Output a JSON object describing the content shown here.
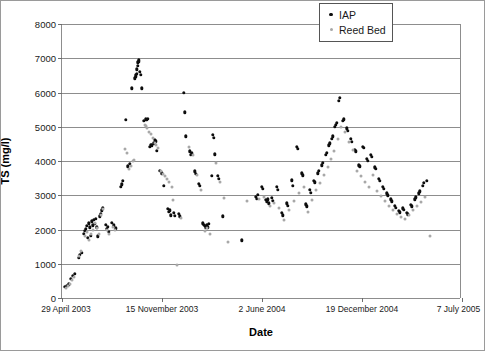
{
  "chart_data": {
    "type": "scatter",
    "title": "",
    "xlabel": "Date",
    "ylabel": "TS (mg/l)",
    "ylim": [
      0,
      8000
    ],
    "ytick_values": [
      0,
      1000,
      2000,
      3000,
      4000,
      5000,
      6000,
      7000,
      8000
    ],
    "ytick_labels": [
      "0",
      "1000",
      "2000",
      "3000",
      "4000",
      "5000",
      "6000",
      "7000",
      "8000"
    ],
    "xtick_labels": [
      "29 April 2003",
      "15 November 2003",
      "2 June 2004",
      "19 December 2004",
      "7 July 2005"
    ],
    "xtick_positions": [
      0,
      0.25,
      0.5,
      0.75,
      1.0
    ],
    "xlim_days": [
      0,
      800
    ],
    "grid": "horizontal",
    "legend_position": "top-right",
    "series": [
      {
        "name": "IAP",
        "color": "#0d0d0d",
        "marker": "filled-circle",
        "points": [
          [
            6,
            320
          ],
          [
            10,
            360
          ],
          [
            14,
            400
          ],
          [
            18,
            560
          ],
          [
            22,
            640
          ],
          [
            26,
            700
          ],
          [
            33,
            1180
          ],
          [
            36,
            1260
          ],
          [
            39,
            1320
          ],
          [
            44,
            1880
          ],
          [
            46,
            1960
          ],
          [
            48,
            2020
          ],
          [
            50,
            2100
          ],
          [
            52,
            1760
          ],
          [
            54,
            2180
          ],
          [
            56,
            2060
          ],
          [
            58,
            1820
          ],
          [
            60,
            2240
          ],
          [
            62,
            2120
          ],
          [
            64,
            2280
          ],
          [
            66,
            2160
          ],
          [
            68,
            2320
          ],
          [
            70,
            2060
          ],
          [
            72,
            1800
          ],
          [
            76,
            2380
          ],
          [
            78,
            2460
          ],
          [
            80,
            2560
          ],
          [
            82,
            2640
          ],
          [
            88,
            2140
          ],
          [
            90,
            2020
          ],
          [
            92,
            2080
          ],
          [
            94,
            1940
          ],
          [
            100,
            2200
          ],
          [
            104,
            2120
          ],
          [
            108,
            2040
          ],
          [
            118,
            3240
          ],
          [
            120,
            3320
          ],
          [
            122,
            3420
          ],
          [
            128,
            5200
          ],
          [
            132,
            3840
          ],
          [
            136,
            3920
          ],
          [
            140,
            6120
          ],
          [
            146,
            6420
          ],
          [
            147,
            6460
          ],
          [
            148,
            6500
          ],
          [
            149,
            6550
          ],
          [
            150,
            6680
          ],
          [
            151,
            6780
          ],
          [
            152,
            6880
          ],
          [
            153,
            6940
          ],
          [
            154,
            6900
          ],
          [
            156,
            6600
          ],
          [
            158,
            6520
          ],
          [
            160,
            6120
          ],
          [
            164,
            5180
          ],
          [
            168,
            5220
          ],
          [
            170,
            5200
          ],
          [
            172,
            5240
          ],
          [
            176,
            4420
          ],
          [
            178,
            4480
          ],
          [
            180,
            4460
          ],
          [
            184,
            4520
          ],
          [
            186,
            4620
          ],
          [
            188,
            4580
          ],
          [
            190,
            4300
          ],
          [
            196,
            3720
          ],
          [
            200,
            3640
          ],
          [
            204,
            3280
          ],
          [
            212,
            2600
          ],
          [
            214,
            2520
          ],
          [
            216,
            2560
          ],
          [
            218,
            2420
          ],
          [
            224,
            2480
          ],
          [
            226,
            2400
          ],
          [
            234,
            2460
          ],
          [
            236,
            2380
          ],
          [
            244,
            6000
          ],
          [
            246,
            5420
          ],
          [
            248,
            4720
          ],
          [
            256,
            4280
          ],
          [
            258,
            4180
          ],
          [
            260,
            4220
          ],
          [
            266,
            3700
          ],
          [
            268,
            3620
          ],
          [
            274,
            3340
          ],
          [
            276,
            3280
          ],
          [
            282,
            2180
          ],
          [
            284,
            2140
          ],
          [
            286,
            2100
          ],
          [
            288,
            2060
          ],
          [
            290,
            2120
          ],
          [
            292,
            2060
          ],
          [
            294,
            2160
          ],
          [
            300,
            3560
          ],
          [
            302,
            4760
          ],
          [
            304,
            4680
          ],
          [
            306,
            4200
          ],
          [
            312,
            3560
          ],
          [
            314,
            3480
          ],
          [
            322,
            2380
          ],
          [
            360,
            1680
          ],
          [
            388,
            2960
          ],
          [
            390,
            2900
          ],
          [
            392,
            3020
          ],
          [
            400,
            3240
          ],
          [
            402,
            3180
          ],
          [
            408,
            2860
          ],
          [
            410,
            2800
          ],
          [
            412,
            2880
          ],
          [
            414,
            2760
          ],
          [
            420,
            2920
          ],
          [
            422,
            2840
          ],
          [
            430,
            3240
          ],
          [
            432,
            3160
          ],
          [
            440,
            2480
          ],
          [
            442,
            2420
          ],
          [
            450,
            2760
          ],
          [
            452,
            2700
          ],
          [
            460,
            3440
          ],
          [
            462,
            3280
          ],
          [
            470,
            4420
          ],
          [
            472,
            4360
          ],
          [
            480,
            3640
          ],
          [
            482,
            3580
          ],
          [
            488,
            2740
          ],
          [
            490,
            2680
          ],
          [
            496,
            3160
          ],
          [
            498,
            3080
          ],
          [
            504,
            3420
          ],
          [
            506,
            3380
          ],
          [
            512,
            3640
          ],
          [
            514,
            3720
          ],
          [
            520,
            3880
          ],
          [
            522,
            3940
          ],
          [
            528,
            4180
          ],
          [
            530,
            4240
          ],
          [
            534,
            4460
          ],
          [
            536,
            4520
          ],
          [
            540,
            4640
          ],
          [
            542,
            4720
          ],
          [
            546,
            5000
          ],
          [
            548,
            5060
          ],
          [
            550,
            5120
          ],
          [
            554,
            5760
          ],
          [
            556,
            5840
          ],
          [
            562,
            5180
          ],
          [
            564,
            5220
          ],
          [
            570,
            4960
          ],
          [
            572,
            4880
          ],
          [
            578,
            4640
          ],
          [
            580,
            4560
          ],
          [
            586,
            4320
          ],
          [
            588,
            4280
          ],
          [
            594,
            3880
          ],
          [
            596,
            3840
          ],
          [
            602,
            4420
          ],
          [
            604,
            4380
          ],
          [
            610,
            4060
          ],
          [
            612,
            4000
          ],
          [
            618,
            4180
          ],
          [
            620,
            4120
          ],
          [
            626,
            3820
          ],
          [
            628,
            3780
          ],
          [
            634,
            3480
          ],
          [
            636,
            3420
          ],
          [
            642,
            3240
          ],
          [
            644,
            3180
          ],
          [
            650,
            3060
          ],
          [
            652,
            3000
          ],
          [
            658,
            2880
          ],
          [
            660,
            2820
          ],
          [
            666,
            2700
          ],
          [
            668,
            2640
          ],
          [
            674,
            2540
          ],
          [
            676,
            2500
          ],
          [
            682,
            2620
          ],
          [
            684,
            2580
          ],
          [
            690,
            2480
          ],
          [
            692,
            2440
          ],
          [
            698,
            2720
          ],
          [
            700,
            2680
          ],
          [
            706,
            2880
          ],
          [
            708,
            2940
          ],
          [
            714,
            3060
          ],
          [
            716,
            3120
          ],
          [
            722,
            3280
          ],
          [
            724,
            3360
          ],
          [
            730,
            3420
          ]
        ]
      },
      {
        "name": "Reed Bed",
        "color": "#a8a8a8",
        "marker": "open-circle",
        "points": [
          [
            8,
            300
          ],
          [
            12,
            340
          ],
          [
            16,
            420
          ],
          [
            20,
            520
          ],
          [
            24,
            620
          ],
          [
            34,
            1220
          ],
          [
            38,
            1380
          ],
          [
            45,
            1820
          ],
          [
            49,
            1940
          ],
          [
            53,
            1700
          ],
          [
            57,
            1880
          ],
          [
            61,
            2000
          ],
          [
            65,
            2180
          ],
          [
            69,
            2040
          ],
          [
            73,
            1880
          ],
          [
            77,
            2420
          ],
          [
            81,
            2600
          ],
          [
            89,
            1980
          ],
          [
            93,
            1880
          ],
          [
            102,
            2060
          ],
          [
            106,
            1980
          ],
          [
            126,
            4340
          ],
          [
            130,
            4240
          ],
          [
            134,
            3780
          ],
          [
            138,
            3860
          ],
          [
            142,
            4000
          ],
          [
            144,
            4020
          ],
          [
            166,
            5060
          ],
          [
            168,
            5020
          ],
          [
            170,
            4960
          ],
          [
            174,
            4860
          ],
          [
            178,
            4780
          ],
          [
            182,
            4680
          ],
          [
            186,
            4540
          ],
          [
            188,
            4460
          ],
          [
            192,
            4380
          ],
          [
            198,
            3700
          ],
          [
            202,
            3620
          ],
          [
            206,
            3560
          ],
          [
            210,
            3460
          ],
          [
            214,
            3400
          ],
          [
            220,
            3240
          ],
          [
            222,
            2860
          ],
          [
            230,
            950
          ],
          [
            238,
            2340
          ],
          [
            254,
            4400
          ],
          [
            262,
            4180
          ],
          [
            270,
            3600
          ],
          [
            278,
            3160
          ],
          [
            286,
            1960
          ],
          [
            290,
            2040
          ],
          [
            296,
            1880
          ],
          [
            308,
            3940
          ],
          [
            316,
            3380
          ],
          [
            324,
            2920
          ],
          [
            332,
            1640
          ],
          [
            370,
            2820
          ],
          [
            394,
            2880
          ],
          [
            404,
            2960
          ],
          [
            416,
            2700
          ],
          [
            424,
            2780
          ],
          [
            434,
            2620
          ],
          [
            444,
            2280
          ],
          [
            454,
            2560
          ],
          [
            464,
            2840
          ],
          [
            474,
            3060
          ],
          [
            484,
            3240
          ],
          [
            492,
            2500
          ],
          [
            500,
            2860
          ],
          [
            508,
            3140
          ],
          [
            516,
            3360
          ],
          [
            524,
            3580
          ],
          [
            532,
            3820
          ],
          [
            538,
            4060
          ],
          [
            544,
            4280
          ],
          [
            552,
            4640
          ],
          [
            558,
            4980
          ],
          [
            566,
            4860
          ],
          [
            574,
            4560
          ],
          [
            582,
            4320
          ],
          [
            590,
            3720
          ],
          [
            598,
            3560
          ],
          [
            606,
            3380
          ],
          [
            614,
            3240
          ],
          [
            622,
            3600
          ],
          [
            630,
            3120
          ],
          [
            638,
            2980
          ],
          [
            646,
            2820
          ],
          [
            654,
            2680
          ],
          [
            662,
            2560
          ],
          [
            670,
            2440
          ],
          [
            678,
            2360
          ],
          [
            686,
            2300
          ],
          [
            694,
            2420
          ],
          [
            702,
            2560
          ],
          [
            710,
            2680
          ],
          [
            718,
            2800
          ],
          [
            726,
            2940
          ],
          [
            736,
            1800
          ]
        ]
      }
    ]
  },
  "legend": {
    "items": [
      {
        "label": "IAP"
      },
      {
        "label": "Reed Bed"
      }
    ]
  }
}
